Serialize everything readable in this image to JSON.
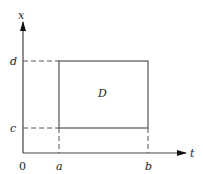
{
  "diagram": {
    "axes": {
      "x_label": "t",
      "y_label": "x",
      "origin_label": "0"
    },
    "ticks": {
      "t": [
        "a",
        "b"
      ],
      "x": [
        "c",
        "d"
      ]
    },
    "region": {
      "label": "D"
    },
    "colors": {
      "line": "#444444",
      "background": "#ffffff"
    }
  }
}
